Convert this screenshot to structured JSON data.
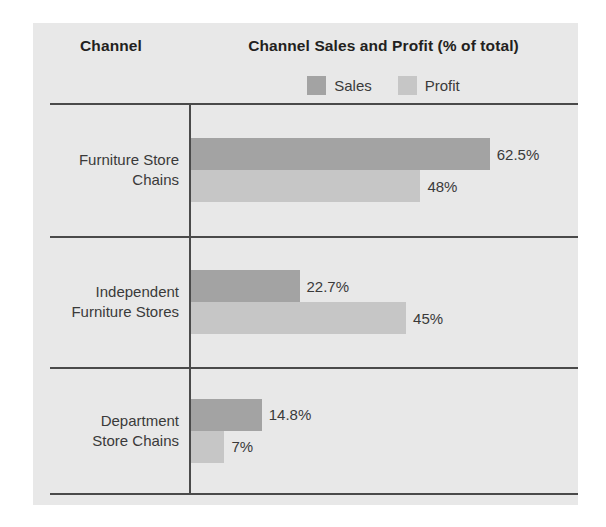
{
  "header": {
    "channel_column_label": "Channel",
    "chart_column_label": "Channel Sales and Profit (% of total)"
  },
  "legend": {
    "position": "top-center",
    "entries": [
      {
        "label": "Sales",
        "color": "#a3a3a3",
        "icon": "legend-swatch-icon"
      },
      {
        "label": "Profit",
        "color": "#c6c6c6",
        "icon": "legend-swatch-icon"
      }
    ]
  },
  "colors": {
    "panel_background": "#e8e8e8",
    "page_background": "#ffffff",
    "rule": "#4a4a4a",
    "text": "#3a3a3a",
    "heading_text": "#231f20",
    "sales_bar": "#a3a3a3",
    "profit_bar": "#c6c6c6"
  },
  "chart_data": {
    "type": "bar",
    "orientation": "horizontal",
    "title": "Channel Sales and Profit (% of total)",
    "xlabel": "",
    "ylabel": "Channel",
    "xlim": [
      0,
      70
    ],
    "grid": false,
    "legend_position": "top-center",
    "axis_tick_labels": [],
    "categories": [
      "Furniture Store Chains",
      "Independent Furniture Stores",
      "Department Store Chains"
    ],
    "series": [
      {
        "name": "Sales",
        "color": "#a3a3a3",
        "values": [
          62.5,
          22.7,
          14.8
        ],
        "labels": [
          "62.5%",
          "22.7%",
          "14.8%"
        ]
      },
      {
        "name": "Profit",
        "color": "#c6c6c6",
        "values": [
          48,
          45,
          7
        ],
        "labels": [
          "48%",
          "45%",
          "7%"
        ]
      }
    ],
    "px_per_unit": 4.78
  },
  "rows": [
    {
      "label_line1": "Furniture Store",
      "label_line2": "Chains",
      "sales_value": "62.5%",
      "profit_value": "48%",
      "sales_width": "299px",
      "profit_width": "229px"
    },
    {
      "label_line1": "Independent",
      "label_line2": "Furniture Stores",
      "sales_value": "22.7%",
      "profit_value": "45%",
      "sales_width": "111px",
      "profit_width": "215px"
    },
    {
      "label_line1": "Department",
      "label_line2": "Store Chains",
      "sales_value": "14.8%",
      "profit_value": "7%",
      "sales_width": "73px",
      "profit_width": "35px"
    }
  ]
}
